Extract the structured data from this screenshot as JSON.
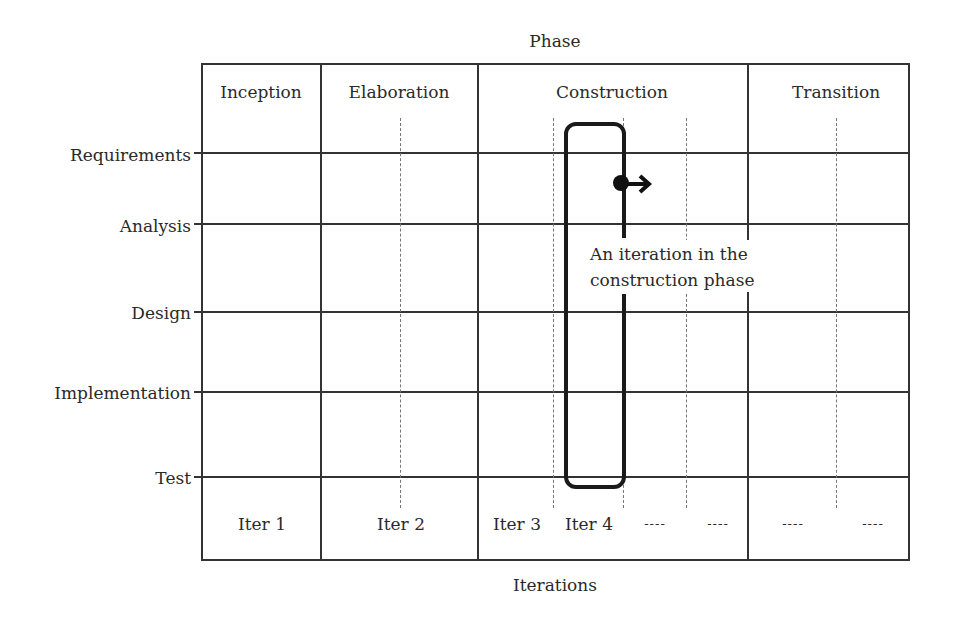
{
  "diagram": {
    "title_top": "Phase",
    "title_bottom": "Iterations",
    "phases": [
      {
        "label": "Inception"
      },
      {
        "label": "Elaboration"
      },
      {
        "label": "Construction"
      },
      {
        "label": "Transition"
      }
    ],
    "workflows": [
      {
        "label": "Requirements"
      },
      {
        "label": "Analysis"
      },
      {
        "label": "Design"
      },
      {
        "label": "Implementation"
      },
      {
        "label": "Test"
      }
    ],
    "iterations": [
      {
        "label": "Iter 1"
      },
      {
        "label": "Iter 2"
      },
      {
        "label": "Iter 3"
      },
      {
        "label": "Iter 4"
      },
      {
        "label": "----"
      },
      {
        "label": "----"
      },
      {
        "label": "----"
      },
      {
        "label": "----"
      }
    ],
    "annotation": {
      "line1": "An iteration in the",
      "line2": "construction phase"
    },
    "colors": {
      "line": "#333333",
      "highlight": "#1a1a1a",
      "text": "#2a2a2a"
    }
  }
}
